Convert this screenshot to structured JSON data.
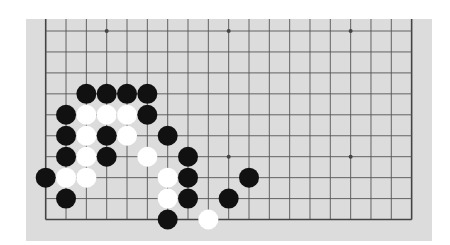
{
  "board": {
    "size": 19,
    "visible_rows": 10,
    "origin_x": 45.7,
    "origin_y": 31,
    "spacing_x": 20.33,
    "spacing_y": 20.95,
    "stone_radius": 10,
    "colors": {
      "board": "#dcdcdc",
      "line": "#555555",
      "edge_line": "#444444",
      "star": "#444444",
      "black_stone": "#111111",
      "white_stone": "#ffffff"
    },
    "star_points": [
      {
        "col": 3,
        "row": 0
      },
      {
        "col": 9,
        "row": 0
      },
      {
        "col": 15,
        "row": 0
      },
      {
        "col": 3,
        "row": 6
      },
      {
        "col": 9,
        "row": 6
      },
      {
        "col": 15,
        "row": 6
      }
    ],
    "stones": [
      {
        "color": "black",
        "col": 2,
        "row": 3
      },
      {
        "color": "black",
        "col": 3,
        "row": 3
      },
      {
        "color": "black",
        "col": 4,
        "row": 3
      },
      {
        "color": "black",
        "col": 5,
        "row": 3
      },
      {
        "color": "black",
        "col": 1,
        "row": 4
      },
      {
        "color": "white",
        "col": 2,
        "row": 4
      },
      {
        "color": "white",
        "col": 3,
        "row": 4
      },
      {
        "color": "white",
        "col": 4,
        "row": 4
      },
      {
        "color": "black",
        "col": 5,
        "row": 4
      },
      {
        "color": "black",
        "col": 1,
        "row": 5
      },
      {
        "color": "white",
        "col": 2,
        "row": 5
      },
      {
        "color": "black",
        "col": 3,
        "row": 5
      },
      {
        "color": "white",
        "col": 4,
        "row": 5
      },
      {
        "color": "black",
        "col": 6,
        "row": 5
      },
      {
        "color": "black",
        "col": 1,
        "row": 6
      },
      {
        "color": "white",
        "col": 2,
        "row": 6
      },
      {
        "color": "black",
        "col": 3,
        "row": 6
      },
      {
        "color": "white",
        "col": 5,
        "row": 6
      },
      {
        "color": "black",
        "col": 7,
        "row": 6
      },
      {
        "color": "black",
        "col": 0,
        "row": 7
      },
      {
        "color": "white",
        "col": 1,
        "row": 7
      },
      {
        "color": "white",
        "col": 2,
        "row": 7
      },
      {
        "color": "white",
        "col": 6,
        "row": 7
      },
      {
        "color": "black",
        "col": 7,
        "row": 7
      },
      {
        "color": "black",
        "col": 10,
        "row": 7
      },
      {
        "color": "black",
        "col": 1,
        "row": 8
      },
      {
        "color": "white",
        "col": 6,
        "row": 8
      },
      {
        "color": "black",
        "col": 7,
        "row": 8
      },
      {
        "color": "black",
        "col": 9,
        "row": 8
      },
      {
        "color": "black",
        "col": 6,
        "row": 9
      },
      {
        "color": "white",
        "col": 8,
        "row": 9
      }
    ]
  }
}
